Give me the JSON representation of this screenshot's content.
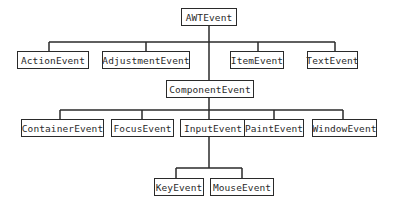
{
  "diagram": {
    "type": "class-hierarchy",
    "root": "AWTEvent",
    "nodes": [
      {
        "id": "awt",
        "label": "AWTEvent",
        "x": 181,
        "y": 8,
        "w": 56,
        "h": 18
      },
      {
        "id": "action",
        "label": "ActionEvent",
        "x": 17,
        "y": 51,
        "w": 72,
        "h": 18
      },
      {
        "id": "adjustment",
        "label": "AdjustmentEvent",
        "x": 102,
        "y": 51,
        "w": 88,
        "h": 18
      },
      {
        "id": "item",
        "label": "ItemEvent",
        "x": 230,
        "y": 51,
        "w": 54,
        "h": 18
      },
      {
        "id": "text",
        "label": "TextEvent",
        "x": 307,
        "y": 51,
        "w": 51,
        "h": 18
      },
      {
        "id": "component",
        "label": "ComponentEvent",
        "x": 166,
        "y": 80,
        "w": 88,
        "h": 18
      },
      {
        "id": "container",
        "label": "ContainerEvent",
        "x": 21,
        "y": 119,
        "w": 83,
        "h": 18
      },
      {
        "id": "focus",
        "label": "FocusEvent",
        "x": 111,
        "y": 119,
        "w": 63,
        "h": 18
      },
      {
        "id": "input",
        "label": "InputEvent",
        "x": 180,
        "y": 119,
        "w": 66,
        "h": 18
      },
      {
        "id": "paint",
        "label": "PaintEvent",
        "x": 244,
        "y": 119,
        "w": 60,
        "h": 18
      },
      {
        "id": "window",
        "label": "WindowEvent",
        "x": 312,
        "y": 119,
        "w": 65,
        "h": 18
      },
      {
        "id": "key",
        "label": "KeyEvent",
        "x": 154,
        "y": 178,
        "w": 50,
        "h": 18
      },
      {
        "id": "mouse",
        "label": "MouseEvent",
        "x": 210,
        "y": 178,
        "w": 64,
        "h": 18
      }
    ],
    "edges": [
      {
        "from": "awt",
        "to": "action"
      },
      {
        "from": "awt",
        "to": "adjustment"
      },
      {
        "from": "awt",
        "to": "item"
      },
      {
        "from": "awt",
        "to": "text"
      },
      {
        "from": "awt",
        "to": "component"
      },
      {
        "from": "component",
        "to": "container"
      },
      {
        "from": "component",
        "to": "focus"
      },
      {
        "from": "component",
        "to": "input"
      },
      {
        "from": "component",
        "to": "paint"
      },
      {
        "from": "component",
        "to": "window"
      },
      {
        "from": "input",
        "to": "key"
      },
      {
        "from": "input",
        "to": "mouse"
      }
    ],
    "line_color": "#2a2a2a",
    "box_border_color": "#2a2a2a",
    "text_color": "#2a2a2a",
    "background": "#ffffff"
  }
}
